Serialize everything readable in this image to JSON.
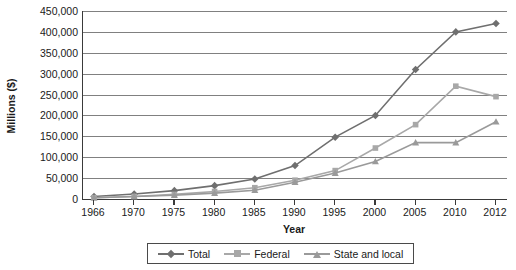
{
  "chart_data": {
    "type": "line",
    "title": "",
    "xlabel": "Year",
    "ylabel": "Millions ($)",
    "categories": [
      "1966",
      "1970",
      "1975",
      "1980",
      "1985",
      "1990",
      "1995",
      "2000",
      "2005",
      "2010",
      "2012"
    ],
    "ylim": [
      0,
      450000
    ],
    "ytick_step": 50000,
    "yticks": [
      "0",
      "50,000",
      "100,000",
      "150,000",
      "200,000",
      "250,000",
      "300,000",
      "350,000",
      "400,000",
      "450,000"
    ],
    "ytick_values": [
      0,
      50000,
      100000,
      150000,
      200000,
      250000,
      300000,
      350000,
      400000,
      450000
    ],
    "grid": true,
    "legend_position": "bottom",
    "series": [
      {
        "name": "Total",
        "marker": "diamond",
        "color": "#6f6f6f",
        "values": [
          6000,
          12000,
          20000,
          32000,
          48000,
          80000,
          148000,
          200000,
          310000,
          400000,
          420000
        ]
      },
      {
        "name": "Federal",
        "marker": "square",
        "color": "#a8a8a8",
        "values": [
          3000,
          6000,
          11000,
          18000,
          27000,
          45000,
          68000,
          122000,
          178000,
          270000,
          245000
        ]
      },
      {
        "name": "State and local",
        "marker": "triangle",
        "color": "#9a9a9a",
        "values": [
          3000,
          6000,
          9000,
          14000,
          21000,
          40000,
          62000,
          90000,
          135000,
          135000,
          185000
        ]
      }
    ]
  },
  "axes": {
    "y_title": "Millions ($)",
    "x_title": "Year"
  },
  "legend": {
    "entries": [
      {
        "label": "Total"
      },
      {
        "label": "Federal"
      },
      {
        "label": "State and local"
      }
    ]
  },
  "colors": {
    "axis": "#3a3a3a",
    "gridline": "#808080",
    "total": "#6f6f6f",
    "federal": "#a8a8a8",
    "state_local": "#9a9a9a",
    "background": "#ffffff"
  }
}
